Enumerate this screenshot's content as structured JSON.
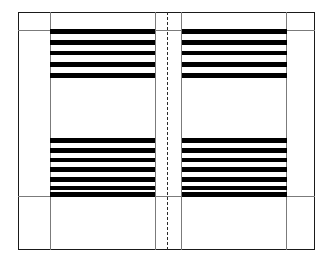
{
  "diagram": {
    "canvas": {
      "width": 333,
      "height": 267,
      "background": "#ffffff"
    },
    "colors": {
      "frame_stroke": "#1a1a1a",
      "guide_stroke": "#7b7b7b",
      "gutter_stroke": "#2a2a2a",
      "text_bar_fill": "#000000",
      "page_fill": "#ffffff"
    },
    "page_frame": {
      "x": 18,
      "y": 12,
      "width": 297,
      "height": 238
    },
    "guides": {
      "vertical": [
        {
          "name": "left-outer-margin-guide",
          "x": 50,
          "y": 12,
          "height": 238
        },
        {
          "name": "right-outer-margin-guide",
          "x": 286,
          "y": 12,
          "height": 238
        },
        {
          "name": "left-gutter-margin-guide",
          "x": 155,
          "y": 12,
          "height": 238
        },
        {
          "name": "right-gutter-margin-guide",
          "x": 181,
          "y": 12,
          "height": 238
        }
      ],
      "horizontal": [
        {
          "name": "top-margin-guide",
          "y": 30,
          "x": 18,
          "width": 297
        },
        {
          "name": "bottom-margin-guide",
          "y": 196,
          "x": 18,
          "width": 297
        }
      ]
    },
    "gutter": {
      "name": "center-fold-line",
      "x": 167,
      "y": 12,
      "height": 238,
      "style": "dashed"
    },
    "text_blocks": [
      {
        "name": "verso-upper-text-block",
        "page": "verso",
        "position": "upper",
        "x": 50,
        "y": 29,
        "width": 105,
        "bars": [
          {
            "top": 0,
            "height": 5
          },
          {
            "top": 11,
            "height": 5
          },
          {
            "top": 22,
            "height": 4
          },
          {
            "top": 33,
            "height": 5
          },
          {
            "top": 44,
            "height": 5
          }
        ]
      },
      {
        "name": "recto-upper-text-block",
        "page": "recto",
        "position": "upper",
        "x": 182,
        "y": 29,
        "width": 105,
        "bars": [
          {
            "top": 0,
            "height": 5
          },
          {
            "top": 11,
            "height": 5
          },
          {
            "top": 22,
            "height": 4
          },
          {
            "top": 33,
            "height": 5
          },
          {
            "top": 44,
            "height": 5
          }
        ]
      },
      {
        "name": "verso-lower-text-block",
        "page": "verso",
        "position": "lower",
        "x": 50,
        "y": 138,
        "width": 105,
        "bars": [
          {
            "top": 0,
            "height": 5
          },
          {
            "top": 10,
            "height": 5
          },
          {
            "top": 20,
            "height": 4
          },
          {
            "top": 29,
            "height": 5
          },
          {
            "top": 39,
            "height": 5
          },
          {
            "top": 48,
            "height": 4
          },
          {
            "top": 54,
            "height": 5
          }
        ]
      },
      {
        "name": "recto-lower-text-block",
        "page": "recto",
        "position": "lower",
        "x": 182,
        "y": 138,
        "width": 105,
        "bars": [
          {
            "top": 0,
            "height": 5
          },
          {
            "top": 10,
            "height": 5
          },
          {
            "top": 20,
            "height": 4
          },
          {
            "top": 29,
            "height": 5
          },
          {
            "top": 39,
            "height": 5
          },
          {
            "top": 48,
            "height": 4
          },
          {
            "top": 54,
            "height": 5
          }
        ]
      }
    ]
  }
}
